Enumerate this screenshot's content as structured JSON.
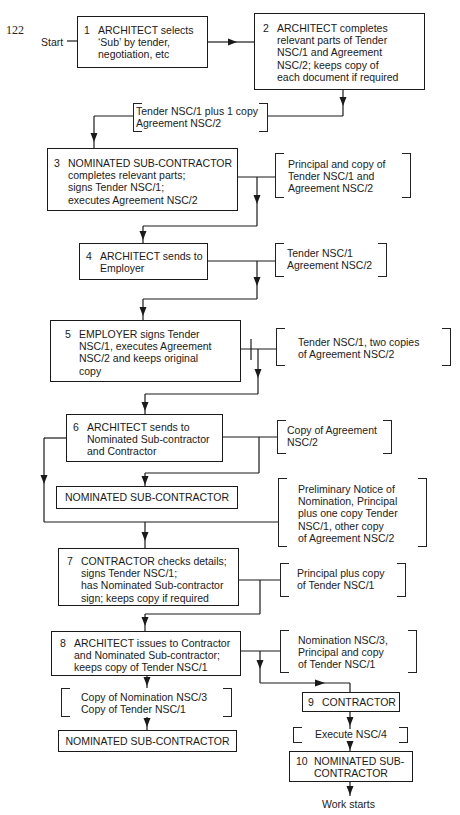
{
  "page_number": "122",
  "start_label": "Start",
  "end_label": "Work starts",
  "steps": [
    {
      "num": "1",
      "lines": [
        "ARCHITECT selects",
        "‘Sub’ by tender,",
        "negotiation, etc"
      ]
    },
    {
      "num": "2",
      "lines": [
        "ARCHITECT completes",
        "relevant parts of Tender",
        "NSC/1 and Agreement",
        "NSC/2; keeps copy of",
        "each document if required"
      ]
    },
    {
      "num": "3",
      "lines": [
        "NOMINATED SUB-CONTRACTOR",
        "completes relevant parts;",
        "signs Tender NSC/1;",
        "executes Agreement NSC/2"
      ]
    },
    {
      "num": "4",
      "lines": [
        "ARCHITECT sends to",
        "Employer"
      ]
    },
    {
      "num": "5",
      "lines": [
        "EMPLOYER signs Tender",
        "NSC/1, executes Agreement",
        "NSC/2 and keeps original",
        "copy"
      ]
    },
    {
      "num": "6",
      "lines": [
        "ARCHITECT sends to",
        "Nominated Sub-contractor",
        "and Contractor"
      ]
    },
    {
      "num": "7",
      "lines": [
        "CONTRACTOR checks details;",
        "signs Tender NSC/1;",
        "has Nominated Sub-contractor",
        "sign; keeps copy if required"
      ]
    },
    {
      "num": "8",
      "lines": [
        "ARCHITECT issues to Contractor",
        "and Nominated Sub-contractor;",
        "keeps copy of Tender NSC/1"
      ]
    },
    {
      "num": "9",
      "lines": [
        "CONTRACTOR"
      ]
    },
    {
      "num": "10",
      "lines": [
        "NOMINATED SUB-",
        "CONTRACTOR"
      ]
    }
  ],
  "recipient_boxes": {
    "after_step_6": "NOMINATED SUB-CONTRACTOR",
    "after_step_8": "NOMINATED SUB-CONTRACTOR"
  },
  "documents": {
    "a": [
      "Tender NSC/1 plus 1 copy",
      "Agreement NSC/2"
    ],
    "b": [
      "Principal and copy of",
      "Tender NSC/1 and",
      "Agreement NSC/2"
    ],
    "c": [
      "Tender NSC/1",
      "Agreement NSC/2"
    ],
    "d": [
      "Tender NSC/1, two copies",
      "of Agreement NSC/2"
    ],
    "e": [
      "Copy of Agreement",
      "NSC/2"
    ],
    "f": [
      "Preliminary Notice of",
      "Nomination, Principal",
      "plus one copy Tender",
      "NSC/1, other copy",
      "of Agreement NSC/2"
    ],
    "g": [
      "Principal plus copy",
      "of Tender NSC/1"
    ],
    "h": [
      "Nomination NSC/3,",
      "Principal and copy",
      "of Tender NSC/1"
    ],
    "i": [
      "Copy of Nomination NSC/3",
      "Copy of Tender NSC/1"
    ],
    "j": [
      "Execute NSC/4"
    ]
  }
}
